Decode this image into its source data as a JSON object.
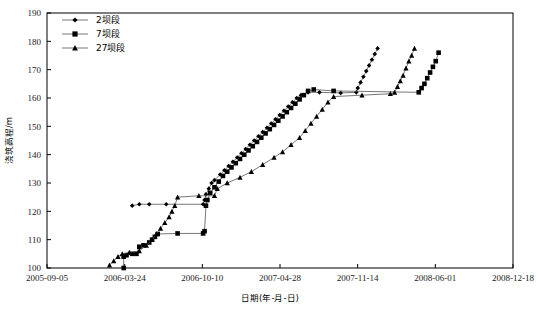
{
  "chart_data": {
    "type": "line",
    "title": "",
    "xlabel": "日期(年-月-日)",
    "ylabel": "浇筑高程/m",
    "ylim": [
      100,
      190
    ],
    "yticks": [
      100,
      110,
      120,
      130,
      140,
      150,
      160,
      170,
      180,
      190
    ],
    "xticks": [
      "2005-09-05",
      "2006-03-24",
      "2006-10-10",
      "2007-04-28",
      "2007-11-14",
      "2008-06-01",
      "2008-12-18"
    ],
    "grid": false,
    "legend_position": "top-left",
    "series": [
      {
        "name": "2坝段",
        "marker": "diamond",
        "points": [
          [
            2006.28,
            122.0
          ],
          [
            2006.33,
            122.5
          ],
          [
            2006.4,
            122.5
          ],
          [
            2006.52,
            122.5
          ],
          [
            2006.78,
            122.5
          ],
          [
            2006.79,
            124.0
          ],
          [
            2006.8,
            126.0
          ],
          [
            2006.82,
            128.0
          ],
          [
            2006.84,
            130.0
          ],
          [
            2006.86,
            131.0
          ],
          [
            2006.9,
            133.0
          ],
          [
            2006.93,
            134.5
          ],
          [
            2006.96,
            136.0
          ],
          [
            2006.99,
            137.5
          ],
          [
            2007.02,
            139.0
          ],
          [
            2007.05,
            140.5
          ],
          [
            2007.08,
            142.0
          ],
          [
            2007.11,
            143.5
          ],
          [
            2007.14,
            145.0
          ],
          [
            2007.17,
            146.5
          ],
          [
            2007.2,
            148.0
          ],
          [
            2007.23,
            149.5
          ],
          [
            2007.26,
            151.0
          ],
          [
            2007.29,
            152.5
          ],
          [
            2007.32,
            154.0
          ],
          [
            2007.35,
            155.5
          ],
          [
            2007.38,
            157.0
          ],
          [
            2007.41,
            158.5
          ],
          [
            2007.44,
            160.0
          ],
          [
            2007.47,
            161.0
          ],
          [
            2007.52,
            162.0
          ],
          [
            2007.6,
            162.0
          ],
          [
            2007.75,
            161.8
          ],
          [
            2007.86,
            162.0
          ],
          [
            2007.87,
            163.5
          ],
          [
            2007.89,
            165.5
          ],
          [
            2007.91,
            167.5
          ],
          [
            2007.93,
            169.5
          ],
          [
            2007.95,
            171.5
          ],
          [
            2007.97,
            173.5
          ],
          [
            2007.99,
            175.5
          ],
          [
            2008.01,
            177.5
          ]
        ]
      },
      {
        "name": "7坝段",
        "marker": "square",
        "points": [
          [
            2006.22,
            100.0
          ],
          [
            2006.22,
            104.0
          ],
          [
            2006.24,
            104.5
          ],
          [
            2006.28,
            105.0
          ],
          [
            2006.31,
            105.0
          ],
          [
            2006.33,
            107.5
          ],
          [
            2006.36,
            108.0
          ],
          [
            2006.4,
            109.0
          ],
          [
            2006.42,
            110.0
          ],
          [
            2006.44,
            111.0
          ],
          [
            2006.46,
            112.0
          ],
          [
            2006.6,
            112.2
          ],
          [
            2006.78,
            112.2
          ],
          [
            2006.79,
            113.0
          ],
          [
            2006.8,
            122.0
          ],
          [
            2006.81,
            124.0
          ],
          [
            2006.83,
            126.5
          ],
          [
            2006.86,
            128.5
          ],
          [
            2006.89,
            130.5
          ],
          [
            2006.92,
            132.5
          ],
          [
            2006.95,
            134.0
          ],
          [
            2006.98,
            135.5
          ],
          [
            2007.01,
            137.0
          ],
          [
            2007.04,
            138.5
          ],
          [
            2007.07,
            140.0
          ],
          [
            2007.1,
            141.5
          ],
          [
            2007.13,
            143.0
          ],
          [
            2007.16,
            144.5
          ],
          [
            2007.19,
            146.0
          ],
          [
            2007.22,
            147.5
          ],
          [
            2007.25,
            149.0
          ],
          [
            2007.28,
            150.5
          ],
          [
            2007.31,
            152.0
          ],
          [
            2007.34,
            153.5
          ],
          [
            2007.37,
            155.0
          ],
          [
            2007.4,
            156.5
          ],
          [
            2007.43,
            158.0
          ],
          [
            2007.46,
            159.5
          ],
          [
            2007.49,
            161.0
          ],
          [
            2007.52,
            162.5
          ],
          [
            2007.56,
            163.0
          ],
          [
            2007.7,
            162.5
          ],
          [
            2008.3,
            162.0
          ],
          [
            2008.32,
            163.5
          ],
          [
            2008.34,
            165.0
          ],
          [
            2008.36,
            167.0
          ],
          [
            2008.38,
            169.0
          ],
          [
            2008.4,
            171.0
          ],
          [
            2008.42,
            173.0
          ],
          [
            2008.44,
            176.0
          ]
        ]
      },
      {
        "name": "27坝段",
        "marker": "triangle",
        "points": [
          [
            2006.12,
            101.0
          ],
          [
            2006.15,
            102.5
          ],
          [
            2006.18,
            104.0
          ],
          [
            2006.21,
            105.0
          ],
          [
            2006.26,
            105.5
          ],
          [
            2006.33,
            106.0
          ],
          [
            2006.38,
            108.0
          ],
          [
            2006.42,
            110.0
          ],
          [
            2006.45,
            112.0
          ],
          [
            2006.48,
            114.0
          ],
          [
            2006.51,
            116.0
          ],
          [
            2006.54,
            118.0
          ],
          [
            2006.56,
            120.0
          ],
          [
            2006.58,
            122.0
          ],
          [
            2006.6,
            125.0
          ],
          [
            2006.75,
            125.5
          ],
          [
            2006.86,
            125.5
          ],
          [
            2006.88,
            128.0
          ],
          [
            2006.95,
            130.0
          ],
          [
            2007.04,
            132.0
          ],
          [
            2007.12,
            134.0
          ],
          [
            2007.2,
            136.5
          ],
          [
            2007.28,
            139.0
          ],
          [
            2007.34,
            141.0
          ],
          [
            2007.4,
            143.5
          ],
          [
            2007.46,
            146.0
          ],
          [
            2007.5,
            148.5
          ],
          [
            2007.54,
            151.0
          ],
          [
            2007.58,
            153.5
          ],
          [
            2007.62,
            156.0
          ],
          [
            2007.66,
            158.5
          ],
          [
            2007.7,
            160.5
          ],
          [
            2007.9,
            161.0
          ],
          [
            2008.1,
            161.5
          ],
          [
            2008.13,
            162.0
          ],
          [
            2008.15,
            164.0
          ],
          [
            2008.17,
            166.0
          ],
          [
            2008.19,
            168.0
          ],
          [
            2008.21,
            170.5
          ],
          [
            2008.23,
            173.0
          ],
          [
            2008.25,
            175.0
          ],
          [
            2008.27,
            177.5
          ]
        ]
      }
    ]
  },
  "legend": {
    "items": [
      {
        "label": "2坝段",
        "marker": "diamond"
      },
      {
        "label": "7坝段",
        "marker": "square"
      },
      {
        "label": "27坝段",
        "marker": "triangle"
      }
    ]
  }
}
